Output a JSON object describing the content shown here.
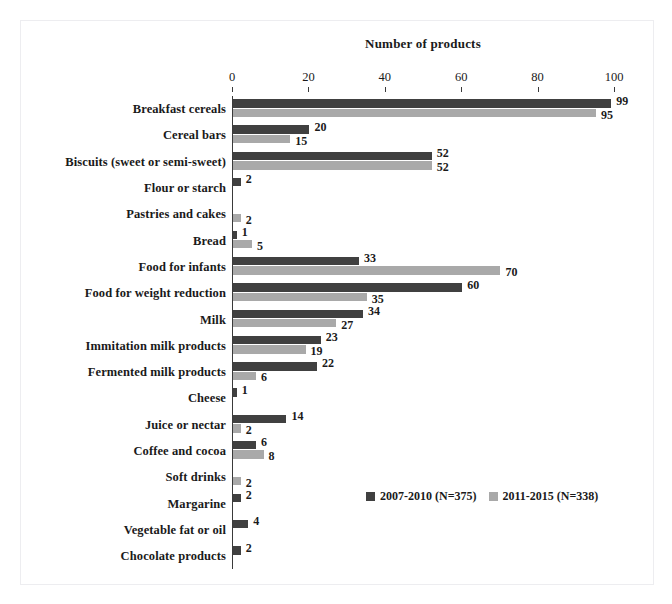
{
  "chart_data": {
    "type": "bar",
    "orientation": "horizontal",
    "title": "Number of products",
    "xlabel": "",
    "ylabel": "",
    "xlim": [
      0,
      100
    ],
    "xticks": [
      0,
      20,
      40,
      60,
      80,
      100
    ],
    "grid": false,
    "legend_position": "inside-bottom-right",
    "colors": {
      "series1": "#404040",
      "series2": "#a9a9a9",
      "axis": "#3a3a3a",
      "text": "#1a1a1a",
      "background": "#ffffff",
      "frame": "#ededf0"
    },
    "categories": [
      "Breakfast cereals",
      "Cereal bars",
      "Biscuits (sweet or semi-sweet)",
      "Flour or starch",
      "Pastries and cakes",
      "Bread",
      "Food for infants",
      "Food for weight reduction",
      "Milk",
      "Immitation milk products",
      "Fermented milk products",
      "Cheese",
      "Juice or nectar",
      "Coffee and cocoa",
      "Soft drinks",
      "Margarine",
      "Vegetable fat or oil",
      "Chocolate products"
    ],
    "series": [
      {
        "name": "2007-2010 (N=375)",
        "color": "#404040",
        "values": [
          99,
          20,
          52,
          2,
          null,
          1,
          33,
          60,
          34,
          23,
          22,
          1,
          14,
          6,
          null,
          2,
          4,
          2
        ]
      },
      {
        "name": "2011-2015 (N=338)",
        "color": "#a9a9a9",
        "values": [
          95,
          15,
          52,
          null,
          2,
          5,
          70,
          35,
          27,
          19,
          6,
          null,
          2,
          8,
          2,
          null,
          null,
          null
        ]
      }
    ],
    "data_labels": {
      "series1": [
        "99",
        "20",
        "52",
        "2",
        "",
        "1",
        "33",
        "60",
        "34",
        "23",
        "22",
        "1",
        "14",
        "6",
        "",
        "2",
        "4",
        "2"
      ],
      "series2": [
        "95",
        "15",
        "52",
        "",
        "2",
        "5",
        "70",
        "35",
        "27",
        "19",
        "6",
        "",
        "2",
        "8",
        "2",
        "",
        "",
        ""
      ]
    }
  },
  "legend": {
    "items": [
      {
        "label": "2007-2010 (N=375)",
        "swatch": "dark"
      },
      {
        "label": "2011-2015 (N=338)",
        "swatch": "light"
      }
    ]
  }
}
